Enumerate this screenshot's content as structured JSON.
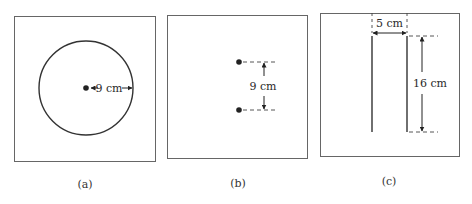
{
  "figure": {
    "panels": [
      {
        "id": "a",
        "caption": "(a)",
        "description": "Circular loop with center point",
        "dimension_label": "9 cm",
        "dimension_type": "radius"
      },
      {
        "id": "b",
        "caption": "(b)",
        "description": "Two point charges separated vertically",
        "dimension_label": "9 cm",
        "dimension_type": "separation"
      },
      {
        "id": "c",
        "caption": "(c)",
        "description": "Two parallel vertical wires",
        "dimension_labels": [
          "5 cm",
          "16 cm"
        ],
        "dimension_types": [
          "separation",
          "length"
        ]
      }
    ],
    "colors": {
      "frame": "#666666",
      "ink": "#222222"
    }
  }
}
